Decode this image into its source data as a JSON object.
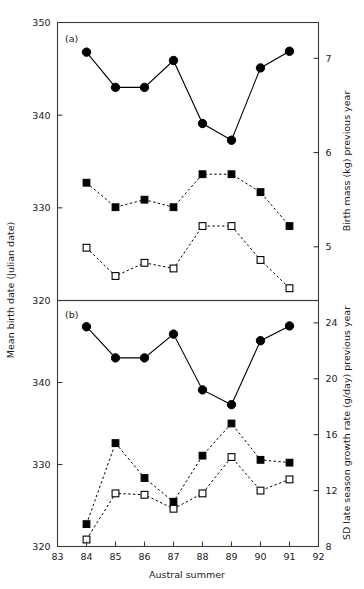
{
  "figure": {
    "xlabel": "Austral summer",
    "left_axis_title": "Mean birth date (Julian date)",
    "panel_a_label": "(a)",
    "panel_b_label": "(b)"
  },
  "chart_data": [
    {
      "type": "line",
      "panel": "(a)",
      "title": "",
      "xlabel": "Austral summer",
      "ylabel": "Mean birth date (Julian date)",
      "y2label": "Birth mass (kg) previous year",
      "x": [
        84,
        85,
        86,
        87,
        88,
        89,
        90,
        91
      ],
      "xlim": [
        83,
        92
      ],
      "xticks": [
        83,
        84,
        85,
        86,
        87,
        88,
        89,
        90,
        91,
        92
      ],
      "xticklabels": [
        "83",
        "84",
        "85",
        "86",
        "87",
        "88",
        "89",
        "90",
        "91",
        "92"
      ],
      "ylim": [
        320,
        350
      ],
      "yticks": [
        320,
        330,
        340,
        350
      ],
      "yticklabels": [
        "320",
        "330",
        "340",
        "350"
      ],
      "y2lim": [
        4.43,
        7.38
      ],
      "y2ticks": [
        5,
        6,
        7
      ],
      "y2ticklabels": [
        "5",
        "6",
        "7"
      ],
      "grid": false,
      "legend": "none",
      "series": [
        {
          "name": "Mean birth date",
          "axis": "left",
          "marker": "filled-circle",
          "linestyle": "solid",
          "values": [
            346.8,
            343.0,
            343.0,
            345.9,
            339.1,
            337.3,
            345.1,
            346.9
          ]
        },
        {
          "name": "Birth mass (kg) previous year",
          "axis": "right",
          "marker": "filled-square",
          "linestyle": "dashed",
          "values": [
            5.68,
            5.42,
            5.5,
            5.42,
            5.77,
            5.77,
            5.58,
            5.22
          ]
        },
        {
          "name": "Birth mass (kg) previous year (open)",
          "axis": "right",
          "marker": "open-square",
          "linestyle": "dashed",
          "values": [
            4.99,
            4.69,
            4.83,
            4.77,
            5.22,
            5.22,
            4.86,
            4.56
          ]
        }
      ]
    },
    {
      "type": "line",
      "panel": "(b)",
      "title": "",
      "xlabel": "Austral summer",
      "ylabel": "Mean birth date (Julian date)",
      "y2label": "SD late season growth rate (g/day) previous year",
      "x": [
        84,
        85,
        86,
        87,
        88,
        89,
        90,
        91
      ],
      "xlim": [
        83,
        92
      ],
      "xticks": [
        83,
        84,
        85,
        86,
        87,
        88,
        89,
        90,
        91,
        92
      ],
      "xticklabels": [
        "83",
        "84",
        "85",
        "86",
        "87",
        "88",
        "89",
        "90",
        "91",
        "92"
      ],
      "ylim": [
        320,
        350
      ],
      "yticks": [
        320,
        330,
        340
      ],
      "yticklabels": [
        "320",
        "330",
        "340"
      ],
      "y2lim": [
        8,
        25.6
      ],
      "y2ticks": [
        8,
        12,
        16,
        20,
        24
      ],
      "y2ticklabels": [
        "8",
        "12",
        "16",
        "20",
        "24"
      ],
      "grid": false,
      "legend": "none",
      "series": [
        {
          "name": "Mean birth date",
          "axis": "left",
          "marker": "filled-circle",
          "linestyle": "solid",
          "values": [
            346.8,
            343.0,
            343.0,
            345.9,
            339.1,
            337.3,
            345.1,
            346.9
          ]
        },
        {
          "name": "SD late season growth rate (g/day) previous year",
          "axis": "right",
          "marker": "filled-square",
          "linestyle": "dashed",
          "values": [
            9.6,
            15.4,
            12.9,
            11.2,
            14.5,
            16.8,
            14.2,
            14.0
          ]
        },
        {
          "name": "SD late season growth rate (g/day) previous year (open)",
          "axis": "right",
          "marker": "open-square",
          "linestyle": "dashed",
          "values": [
            8.5,
            11.8,
            11.7,
            10.7,
            11.8,
            14.4,
            12.0,
            12.8
          ]
        }
      ]
    }
  ]
}
